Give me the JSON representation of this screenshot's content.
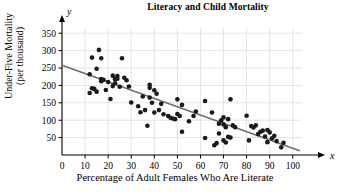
{
  "chart_data": {
    "type": "scatter",
    "title": "Literacy and Child Mortality",
    "xlabel": "Percentage of Adult Females Who Are Literate",
    "ylabel": "Under-Five Mortality (per thousand)",
    "ylabel_line1": "Under-Five Mortality",
    "ylabel_line2": "(per thousand)",
    "x_var_symbol": "x",
    "y_var_symbol": "y",
    "xlim": [
      0,
      104
    ],
    "ylim": [
      0,
      365
    ],
    "xticks": [
      0,
      10,
      20,
      30,
      40,
      50,
      60,
      70,
      80,
      90,
      100
    ],
    "yticks": [
      50,
      100,
      150,
      200,
      250,
      300,
      350
    ],
    "grid": true,
    "grid_color": "#d8d8d8",
    "axis_color": "#000000",
    "point_color": "#1a1a1a",
    "point_radius": 2.3,
    "trendline": {
      "color": "#6e6e6e",
      "width": 1.6,
      "x_start": 0,
      "y_start": 258,
      "x_end": 103,
      "y_end": 12
    },
    "points": [
      [
        12,
        232
      ],
      [
        12,
        178
      ],
      [
        13,
        280
      ],
      [
        13,
        192
      ],
      [
        14,
        190
      ],
      [
        15,
        248
      ],
      [
        15,
        182
      ],
      [
        16,
        302
      ],
      [
        17,
        218
      ],
      [
        17,
        278
      ],
      [
        17,
        212
      ],
      [
        18,
        216
      ],
      [
        19,
        187
      ],
      [
        20,
        210
      ],
      [
        21,
        161
      ],
      [
        22,
        228
      ],
      [
        22,
        198
      ],
      [
        23,
        218
      ],
      [
        23,
        206
      ],
      [
        24,
        227
      ],
      [
        24,
        219
      ],
      [
        25,
        196
      ],
      [
        26,
        278
      ],
      [
        27,
        222
      ],
      [
        28,
        215
      ],
      [
        29,
        197
      ],
      [
        30,
        151
      ],
      [
        33,
        140
      ],
      [
        34,
        123
      ],
      [
        35,
        168
      ],
      [
        36,
        129
      ],
      [
        37,
        84
      ],
      [
        38,
        202
      ],
      [
        38,
        193
      ],
      [
        38,
        165
      ],
      [
        39,
        150
      ],
      [
        40,
        186
      ],
      [
        40,
        122
      ],
      [
        41,
        176
      ],
      [
        42,
        129
      ],
      [
        43,
        147
      ],
      [
        44,
        117
      ],
      [
        46,
        112
      ],
      [
        47,
        107
      ],
      [
        48,
        105
      ],
      [
        49,
        103
      ],
      [
        50,
        118
      ],
      [
        50,
        160
      ],
      [
        51,
        112
      ],
      [
        52,
        67
      ],
      [
        52,
        144
      ],
      [
        55,
        97
      ],
      [
        57,
        112
      ],
      [
        58,
        125
      ],
      [
        62,
        155
      ],
      [
        62,
        49
      ],
      [
        65,
        122
      ],
      [
        66,
        28
      ],
      [
        67,
        34
      ],
      [
        68,
        90
      ],
      [
        68,
        62
      ],
      [
        69,
        100
      ],
      [
        70,
        108
      ],
      [
        70,
        88
      ],
      [
        70,
        42
      ],
      [
        71,
        80
      ],
      [
        71,
        36
      ],
      [
        72,
        103
      ],
      [
        72,
        52
      ],
      [
        73,
        160
      ],
      [
        73,
        50
      ],
      [
        74,
        85
      ],
      [
        75,
        80
      ],
      [
        80,
        113
      ],
      [
        81,
        42
      ],
      [
        82,
        83
      ],
      [
        83,
        79
      ],
      [
        84,
        85
      ],
      [
        85,
        60
      ],
      [
        86,
        67
      ],
      [
        87,
        70
      ],
      [
        88,
        53
      ],
      [
        89,
        72
      ],
      [
        89,
        37
      ],
      [
        90,
        65
      ],
      [
        91,
        48
      ],
      [
        92,
        55
      ],
      [
        93,
        40
      ],
      [
        95,
        22
      ],
      [
        96,
        35
      ]
    ]
  }
}
